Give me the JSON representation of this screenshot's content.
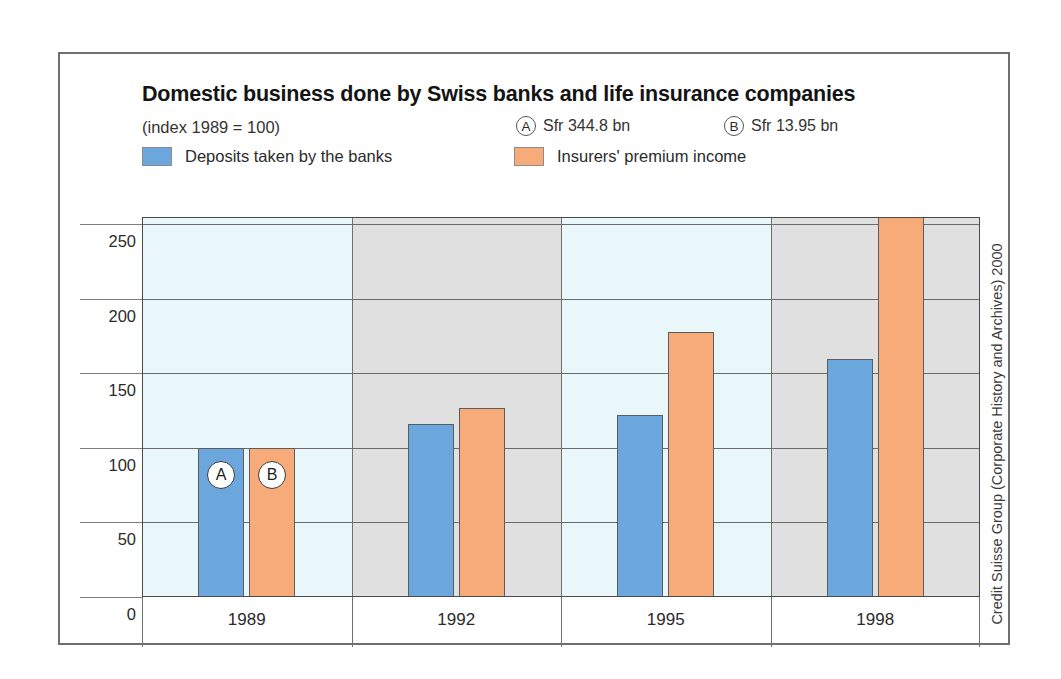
{
  "header": {
    "title": "Domestic business done by Swiss banks and life insurance companies",
    "index_note": "(index 1989 = 100)",
    "key_refs": [
      {
        "marker": "A",
        "text": "Sfr 344.8 bn"
      },
      {
        "marker": "B",
        "text": "Sfr 13.95 bn"
      }
    ]
  },
  "credit": "Credit Suisse Group (Corporate History and Archives) 2000",
  "colors": {
    "series_blue": "#6ba7dc",
    "series_orange": "#f7ab79",
    "band_blue": "#eaf7fa",
    "band_gray": "#e0e0e0",
    "frame": "#6f6f6f",
    "gridline": "#6b6b6b"
  },
  "chart_data": {
    "type": "bar",
    "title": "Domestic business done by Swiss banks and life insurance companies",
    "subtitle": "(index 1989 = 100)",
    "xlabel": "",
    "ylabel": "",
    "categories": [
      "1989",
      "1992",
      "1995",
      "1998"
    ],
    "ylim": [
      0,
      255
    ],
    "yticks": [
      0,
      50,
      100,
      150,
      200,
      250
    ],
    "ytick_labels": [
      "0",
      "50",
      "100",
      "150",
      "200",
      "250"
    ],
    "grid": true,
    "legend_position": "top",
    "series": [
      {
        "name": "Deposits taken by the banks",
        "color": "#6ba7dc",
        "values": [
          100,
          116,
          122,
          160
        ],
        "base_value_note": "A  Sfr 344.8 bn"
      },
      {
        "name": "Insurers' premium income",
        "color": "#f7ab79",
        "values": [
          100,
          127,
          178,
          262
        ],
        "base_value_note": "B  Sfr 13.95 bn"
      }
    ],
    "annotations": [
      {
        "label": "A",
        "category": "1989",
        "series": "Deposits taken by the banks"
      },
      {
        "label": "B",
        "category": "1989",
        "series": "Insurers' premium income"
      }
    ]
  }
}
